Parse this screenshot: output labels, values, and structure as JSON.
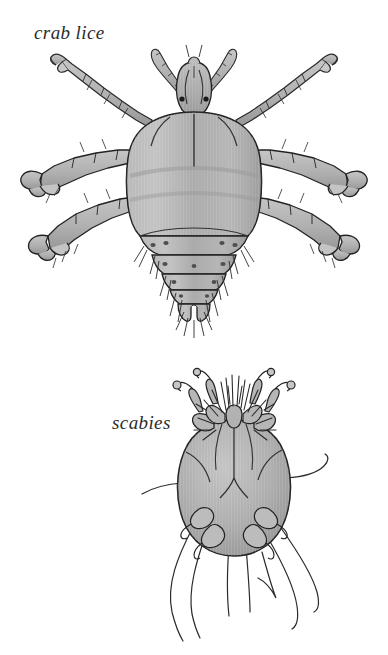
{
  "page": {
    "background_color": "#ffffff",
    "width": 388,
    "height": 655,
    "kind": "scientific-illustration-plate"
  },
  "palette": {
    "background": "#ffffff",
    "body_fill_light": "#c0c0c0",
    "body_fill_mid": "#a9a9a9",
    "body_fill_dark": "#8f8f8f",
    "limb_fill": "#b4b4b4",
    "outline": "#222222",
    "hair_stroke": "#2a2a2a",
    "eye_spot": "#1a1a1a",
    "caption_color": "#2b2b2b"
  },
  "figures": [
    {
      "id": "crab-lice",
      "caption": "crab lice",
      "caption_style": "italic",
      "organism": "Pthirus pubis (crab louse), dorsal view",
      "caption_position": {
        "x": 34,
        "y": 22
      },
      "anatomy": {
        "head": "small, with two segmented antennae and two dark eye spots",
        "eyes": 2,
        "antennae": 2,
        "thorax": "broad fused shield with central midline groove",
        "abdomen": "segmented with lateral dark spiracles and bristle tufts",
        "legs": 6,
        "claws": "large crab-like grasping claws on middle and hind legs"
      }
    },
    {
      "id": "scabies",
      "caption": "scabies",
      "caption_style": "italic",
      "organism": "Sarcoptes scabiei (itch mite), dorsal view",
      "caption_position": {
        "x": 112,
        "y": 412
      },
      "anatomy": {
        "body": "rounded oval tortoise-like body",
        "legs": 8,
        "front_leg_suckers": "stalked knobbed pretarsi on front two pairs",
        "rear_legs": "short stubs bearing long trailing whip-like setae",
        "bristles": "dense fringe of long dorsal setae around the gnathosoma"
      }
    }
  ]
}
